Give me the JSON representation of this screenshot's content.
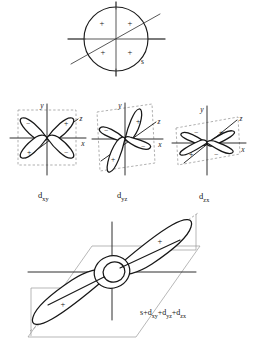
{
  "figure": {
    "background_color": "#ffffff",
    "ink_color": "#171717",
    "dash_color": "#8e8e8e"
  },
  "s_orbital": {
    "label": "s",
    "shape": "circle",
    "signs": [
      "+",
      "+",
      "+",
      "+"
    ],
    "sign_positions": [
      {
        "sign": "+",
        "x": 102,
        "y": 24
      },
      {
        "sign": "+",
        "x": 129,
        "y": 24
      },
      {
        "sign": "+",
        "x": 103,
        "y": 52
      },
      {
        "sign": "+",
        "x": 129,
        "y": 52
      }
    ],
    "center": {
      "x": 116,
      "y": 39
    },
    "radius": 32,
    "axes": [
      "x",
      "y",
      "z"
    ]
  },
  "d_orbitals": [
    {
      "name": "d-xy",
      "label_main": "d",
      "label_sub": "xy",
      "center": {
        "x": 47,
        "y": 137
      },
      "axis_labels": [
        "y",
        "x",
        "z"
      ],
      "lobe_signs": [
        "−",
        "+",
        "+",
        "−"
      ],
      "lobes": [
        {
          "sign": "−",
          "quadrant": "upper-left"
        },
        {
          "sign": "+",
          "quadrant": "upper-right"
        },
        {
          "sign": "+",
          "quadrant": "lower-left"
        },
        {
          "sign": "−",
          "quadrant": "lower-right"
        }
      ]
    },
    {
      "name": "d-yz",
      "label_main": "d",
      "label_sub": "yz",
      "center": {
        "x": 125,
        "y": 137
      },
      "axis_labels": [
        "y",
        "x",
        "z"
      ],
      "lobe_signs": [
        "−",
        "+",
        "+",
        "−"
      ],
      "lobes": [
        {
          "sign": "+",
          "quadrant": "upper-right"
        },
        {
          "sign": "−",
          "quadrant": "upper-left"
        },
        {
          "sign": "−",
          "quadrant": "lower-right"
        },
        {
          "sign": "+",
          "quadrant": "lower-left"
        }
      ]
    },
    {
      "name": "d-zx",
      "label_main": "d",
      "label_sub": "zx",
      "center": {
        "x": 207,
        "y": 141
      },
      "axis_labels": [
        "y",
        "x",
        "z"
      ],
      "lobe_signs": [
        "−",
        "+",
        "+",
        "−"
      ],
      "lobes": [
        {
          "sign": "−",
          "quadrant": "upper-left"
        },
        {
          "sign": "+",
          "quadrant": "upper-right"
        },
        {
          "sign": "+",
          "quadrant": "lower-left"
        },
        {
          "sign": "−",
          "quadrant": "lower-right"
        }
      ]
    }
  ],
  "labels": {
    "d_xy": {
      "main": "d",
      "sub": "xy"
    },
    "d_yz": {
      "main": "d",
      "sub": "yz"
    },
    "d_zx": {
      "main": "d",
      "sub": "zx"
    }
  },
  "hybrid_orbital": {
    "formula_parts": [
      {
        "main": "s",
        "sub": ""
      },
      {
        "op": "+",
        "main": "d",
        "sub": "xy"
      },
      {
        "op": "+",
        "main": "d",
        "sub": "yz"
      },
      {
        "op": "+",
        "main": "d",
        "sub": "zx"
      }
    ],
    "formula_plain": "s+dxy+dyz+dzx",
    "lobe_signs": [
      "+",
      "+"
    ],
    "description": "Two large opposed lobes along a diagonal with a small torus knot at the origin",
    "center": {
      "x": 112,
      "y": 272
    }
  }
}
